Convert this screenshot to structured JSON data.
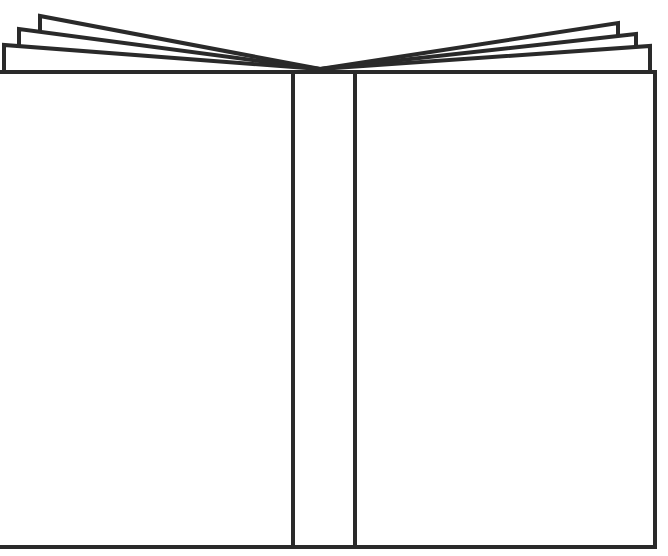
{
  "image": {
    "title": "Open book outline",
    "subject": "open-book-line-drawing",
    "width": 668,
    "height": 556
  },
  "colors": {
    "background": "#ffffff",
    "stroke": "#2a2a2a",
    "page_fill": "#ffffff"
  },
  "book": {
    "stroke_width": 4,
    "cover_top_y": 72,
    "cover_bottom_y": 547,
    "left_cover": {
      "x1": -2,
      "x2": 293
    },
    "spine": {
      "x1": 293,
      "x2": 355
    },
    "right_cover": {
      "x1": 355,
      "x2": 655
    },
    "apex": {
      "x": 320,
      "y": 69
    },
    "left_pages": [
      {
        "edge_x": 4,
        "top_y": 45
      },
      {
        "edge_x": 19,
        "top_y": 29
      },
      {
        "edge_x": 40,
        "top_y": 16
      }
    ],
    "right_pages": [
      {
        "edge_x": 650,
        "top_y": 46
      },
      {
        "edge_x": 636,
        "top_y": 34
      },
      {
        "edge_x": 618,
        "top_y": 23
      }
    ]
  }
}
